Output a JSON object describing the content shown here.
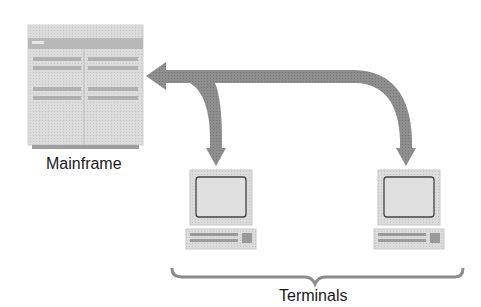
{
  "diagram": {
    "mainframe": {
      "label": "Mainframe",
      "icon": "mainframe-icon"
    },
    "terminals": {
      "label": "Terminals",
      "items": [
        {
          "icon": "terminal-icon"
        },
        {
          "icon": "terminal-icon"
        }
      ]
    },
    "arrow": {
      "description": "bidirectional curved arrow connecting mainframe to terminals",
      "color": "#8c8c8c"
    },
    "colors": {
      "device_fill": "#d9d9d9",
      "device_band": "#bdbdbd",
      "arrow": "#8c8c8c",
      "text": "#1a1a1a"
    }
  }
}
